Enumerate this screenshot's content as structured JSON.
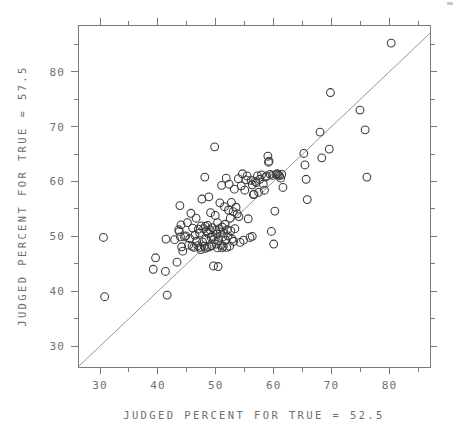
{
  "chart_data": {
    "type": "scatter",
    "title": "",
    "xlabel": "JUDGED PERCENT FOR TRUE = 52.5",
    "ylabel": "JUDGED PERCENT FOR TRUE = 57.5",
    "xlim": [
      26.2,
      87.0
    ],
    "ylim": [
      26.2,
      88.5
    ],
    "xticks": [
      30,
      40,
      50,
      60,
      70,
      80
    ],
    "yticks": [
      30,
      40,
      50,
      60,
      70,
      80
    ],
    "xticklabels": [
      "30",
      "40",
      "50",
      "60",
      "70",
      "80"
    ],
    "yticklabels": [
      "30",
      "40",
      "50",
      "60",
      "70",
      "80"
    ],
    "minor_tick_interval": 5,
    "grid": false,
    "legend": null,
    "marker": "open-circle",
    "marker_size_px": 5.2,
    "reference_line": {
      "type": "identity",
      "label": "y = x",
      "from": [
        26.2,
        26.2
      ],
      "to": [
        87.0,
        87.0
      ]
    },
    "n_points": 146,
    "points": [
      [
        30.6,
        49.8
      ],
      [
        30.8,
        39.0
      ],
      [
        39.2,
        44.0
      ],
      [
        39.6,
        46.1
      ],
      [
        41.3,
        43.6
      ],
      [
        41.4,
        49.5
      ],
      [
        41.6,
        39.3
      ],
      [
        43.3,
        45.3
      ],
      [
        43.6,
        51.2
      ],
      [
        43.7,
        50.9
      ],
      [
        43.8,
        55.6
      ],
      [
        43.9,
        49.9
      ],
      [
        44.1,
        48.1
      ],
      [
        44.3,
        47.3
      ],
      [
        44.6,
        49.9
      ],
      [
        44.8,
        50.1
      ],
      [
        45.1,
        52.5
      ],
      [
        45.3,
        48.4
      ],
      [
        45.5,
        49.6
      ],
      [
        45.7,
        54.2
      ],
      [
        45.9,
        48.2
      ],
      [
        46.0,
        51.5
      ],
      [
        46.2,
        48.0
      ],
      [
        46.4,
        50.2
      ],
      [
        46.6,
        53.3
      ],
      [
        46.7,
        49.1
      ],
      [
        46.9,
        48.3
      ],
      [
        47.0,
        51.3
      ],
      [
        47.2,
        50.6
      ],
      [
        47.3,
        48.0
      ],
      [
        47.5,
        51.9
      ],
      [
        47.6,
        56.8
      ],
      [
        47.7,
        49.0
      ],
      [
        47.9,
        51.4
      ],
      [
        48.0,
        48.2
      ],
      [
        48.1,
        60.8
      ],
      [
        48.2,
        51.8
      ],
      [
        48.3,
        49.5
      ],
      [
        48.4,
        51.0
      ],
      [
        48.5,
        48.0
      ],
      [
        48.6,
        52.0
      ],
      [
        48.7,
        50.5
      ],
      [
        48.8,
        57.2
      ],
      [
        48.9,
        48.1
      ],
      [
        49.0,
        51.2
      ],
      [
        49.1,
        54.3
      ],
      [
        49.2,
        49.8
      ],
      [
        49.3,
        48.3
      ],
      [
        49.4,
        51.6
      ],
      [
        49.5,
        50.0
      ],
      [
        49.6,
        44.6
      ],
      [
        49.7,
        49.4
      ],
      [
        49.8,
        66.3
      ],
      [
        49.9,
        53.8
      ],
      [
        50.0,
        51.1
      ],
      [
        50.1,
        48.6
      ],
      [
        50.2,
        50.4
      ],
      [
        50.3,
        52.5
      ],
      [
        50.4,
        44.5
      ],
      [
        50.5,
        49.2
      ],
      [
        50.6,
        51.4
      ],
      [
        50.7,
        56.1
      ],
      [
        50.8,
        50.8
      ],
      [
        50.9,
        48.4
      ],
      [
        51.0,
        59.3
      ],
      [
        51.1,
        51.7
      ],
      [
        51.2,
        49.9
      ],
      [
        51.3,
        48.2
      ],
      [
        51.4,
        50.6
      ],
      [
        51.5,
        55.4
      ],
      [
        51.6,
        52.2
      ],
      [
        51.7,
        49.3
      ],
      [
        51.8,
        60.6
      ],
      [
        51.9,
        48.0
      ],
      [
        52.0,
        51.2
      ],
      [
        52.1,
        50.1
      ],
      [
        52.2,
        54.8
      ],
      [
        52.3,
        59.5
      ],
      [
        52.4,
        48.2
      ],
      [
        52.5,
        53.3
      ],
      [
        52.6,
        51.0
      ],
      [
        52.7,
        56.2
      ],
      [
        52.8,
        49.5
      ],
      [
        53.0,
        54.5
      ],
      [
        53.2,
        58.6
      ],
      [
        53.3,
        51.4
      ],
      [
        53.5,
        55.3
      ],
      [
        53.7,
        54.1
      ],
      [
        53.9,
        60.5
      ],
      [
        54.0,
        53.6
      ],
      [
        54.2,
        48.9
      ],
      [
        54.4,
        59.2
      ],
      [
        54.6,
        61.4
      ],
      [
        54.8,
        49.3
      ],
      [
        55.0,
        58.4
      ],
      [
        55.2,
        60.3
      ],
      [
        55.4,
        61.0
      ],
      [
        55.6,
        53.2
      ],
      [
        55.9,
        49.8
      ],
      [
        56.1,
        60.2
      ],
      [
        56.3,
        59.4
      ],
      [
        56.5,
        57.6
      ],
      [
        56.6,
        57.7
      ],
      [
        56.8,
        60.0
      ],
      [
        57.0,
        59.8
      ],
      [
        57.2,
        61.0
      ],
      [
        57.4,
        58.0
      ],
      [
        57.6,
        60.4
      ],
      [
        57.9,
        61.2
      ],
      [
        58.2,
        59.5
      ],
      [
        58.4,
        58.4
      ],
      [
        58.6,
        60.8
      ],
      [
        58.8,
        61.0
      ],
      [
        59.0,
        64.6
      ],
      [
        59.1,
        63.5
      ],
      [
        59.2,
        63.7
      ],
      [
        59.4,
        61.3
      ],
      [
        59.6,
        50.9
      ],
      [
        59.8,
        61.1
      ],
      [
        60.0,
        48.6
      ],
      [
        60.2,
        54.6
      ],
      [
        60.4,
        61.3
      ],
      [
        60.6,
        61.4
      ],
      [
        60.8,
        61.2
      ],
      [
        61.0,
        61.0
      ],
      [
        61.2,
        60.6
      ],
      [
        61.4,
        61.3
      ],
      [
        61.6,
        58.9
      ],
      [
        65.2,
        65.1
      ],
      [
        65.4,
        63.0
      ],
      [
        65.6,
        60.4
      ],
      [
        65.8,
        56.7
      ],
      [
        68.0,
        69.0
      ],
      [
        68.3,
        64.3
      ],
      [
        69.6,
        65.9
      ],
      [
        69.8,
        76.2
      ],
      [
        74.9,
        73.0
      ],
      [
        75.8,
        69.4
      ],
      [
        76.1,
        60.8
      ],
      [
        80.3,
        85.2
      ],
      [
        42.9,
        49.4
      ],
      [
        44.0,
        52.1
      ],
      [
        47.4,
        47.6
      ],
      [
        48.2,
        47.8
      ],
      [
        50.3,
        47.9
      ],
      [
        51.1,
        47.9
      ],
      [
        53.1,
        49.1
      ],
      [
        56.3,
        50.0
      ]
    ]
  },
  "plot_geometry": {
    "frame_left_px": 78,
    "frame_right_px": 430,
    "frame_top_px": 25,
    "frame_bottom_px": 367
  }
}
